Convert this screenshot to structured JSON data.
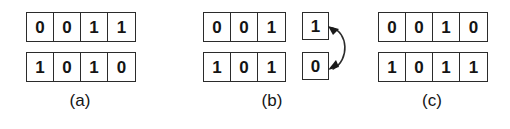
{
  "figure": {
    "background_color": "#ffffff",
    "line_color": "#2b2b2b",
    "text_color": "#141414",
    "panels": [
      {
        "id": "a",
        "label": "(a)",
        "label_left": 60,
        "left": 26,
        "rows": [
          {
            "name": "top",
            "bits": [
              "0",
              "0",
              "1",
              "1"
            ]
          },
          {
            "name": "bottom",
            "bits": [
              "1",
              "0",
              "1",
              "0"
            ]
          }
        ],
        "single_boxes": [],
        "has_swap_arrow": false
      },
      {
        "id": "b",
        "label": "(b)",
        "label_left": 252,
        "left": 203,
        "rows": [
          {
            "name": "top",
            "bits": [
              "0",
              "0",
              "1"
            ]
          },
          {
            "name": "bottom",
            "bits": [
              "1",
              "0",
              "1"
            ]
          }
        ],
        "single_boxes": [
          {
            "name": "top-single",
            "value": "1",
            "left": 302,
            "top": 12
          },
          {
            "name": "bottom-single",
            "value": "0",
            "left": 302,
            "top": 52
          }
        ],
        "has_swap_arrow": true
      },
      {
        "id": "c",
        "label": "(c)",
        "label_left": 412,
        "left": 378,
        "rows": [
          {
            "name": "top",
            "bits": [
              "0",
              "0",
              "1",
              "0"
            ]
          },
          {
            "name": "bottom",
            "bits": [
              "1",
              "0",
              "1",
              "1"
            ]
          }
        ],
        "single_boxes": [],
        "has_swap_arrow": false
      }
    ]
  }
}
